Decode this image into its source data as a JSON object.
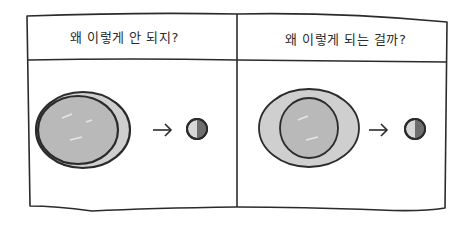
{
  "panels": [
    {
      "caption": "왜 이렇게 안 되지?",
      "illustration": {
        "outer_shape": "egg-ellipse",
        "inner_circle": "offset-left",
        "arrow": "→",
        "result": "half-shaded-small-circle"
      }
    },
    {
      "caption": "왜 이렇게 되는 걸까?",
      "illustration": {
        "outer_shape": "egg-ellipse",
        "inner_circle": "centered",
        "arrow": "→",
        "result": "half-shaded-small-circle"
      }
    }
  ],
  "colors": {
    "ink": "#2b2b2b",
    "fill_light": "#cfcfcf",
    "fill_mid": "#b9b9b9",
    "shade_dark": "#6e6e6e",
    "background": "#ffffff"
  }
}
